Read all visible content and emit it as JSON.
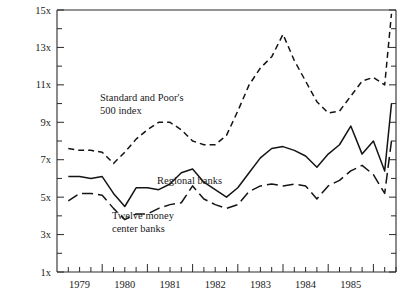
{
  "chart_data": {
    "type": "line",
    "title": "",
    "xlabel": "",
    "ylabel": "",
    "ylim": [
      1,
      15
    ],
    "xlim": [
      1978.5,
      1986.0
    ],
    "grid": false,
    "legend_position": "inline-annotations",
    "y_ticks_major": [
      "1x",
      "3x",
      "5x",
      "7x",
      "9x",
      "11x",
      "13x",
      "15x"
    ],
    "y_tick_values_major": [
      1,
      3,
      5,
      7,
      9,
      11,
      13,
      15
    ],
    "y_tick_values_minor": [
      2,
      4,
      6,
      8,
      10,
      12,
      14
    ],
    "x_tick_labels": [
      "1979",
      "1980",
      "1981",
      "1982",
      "1983",
      "1984",
      "1985"
    ],
    "x_tick_label_values": [
      1979,
      1980,
      1981,
      1982,
      1983,
      1984,
      1985
    ],
    "x_minor_step": 0.25,
    "annotations": [
      {
        "name": "sp500-label",
        "lines": [
          "Standard and Poor's",
          "500 index"
        ],
        "x": 100,
        "y": 101
      },
      {
        "name": "regional-banks-label",
        "lines": [
          "Regional banks"
        ],
        "x": 157,
        "y": 184
      },
      {
        "name": "money-center-label",
        "lines": [
          "Twelve money",
          "center banks"
        ],
        "x": 112,
        "y": 219
      }
    ],
    "series": [
      {
        "name": "Standard and Poor's 500 index",
        "style": "dashed",
        "dash": "6,4",
        "x": [
          1978.75,
          1979.0,
          1979.25,
          1979.5,
          1979.75,
          1980.0,
          1980.25,
          1980.5,
          1980.75,
          1981.0,
          1981.25,
          1981.5,
          1981.75,
          1982.0,
          1982.25,
          1982.5,
          1982.75,
          1983.0,
          1983.25,
          1983.5,
          1983.75,
          1984.0,
          1984.25,
          1984.5,
          1984.75,
          1985.0,
          1985.25,
          1985.5,
          1985.75,
          1985.9
        ],
        "values": [
          7.6,
          7.5,
          7.5,
          7.4,
          6.8,
          7.4,
          8.1,
          8.6,
          9.0,
          9.0,
          8.6,
          8.0,
          7.8,
          7.8,
          8.3,
          9.6,
          11.0,
          11.9,
          12.5,
          13.7,
          12.3,
          11.2,
          10.1,
          9.5,
          9.6,
          10.4,
          11.2,
          11.4,
          11.0,
          14.8
        ]
      },
      {
        "name": "Regional banks",
        "style": "solid",
        "dash": "none",
        "x": [
          1978.75,
          1979.0,
          1979.25,
          1979.5,
          1979.75,
          1980.0,
          1980.25,
          1980.5,
          1980.75,
          1981.0,
          1981.25,
          1981.5,
          1981.75,
          1982.0,
          1982.25,
          1982.5,
          1982.75,
          1983.0,
          1983.25,
          1983.5,
          1983.75,
          1984.0,
          1984.25,
          1984.5,
          1984.75,
          1985.0,
          1985.25,
          1985.5,
          1985.75,
          1985.9
        ],
        "values": [
          6.1,
          6.1,
          6.0,
          6.1,
          5.2,
          4.5,
          5.5,
          5.5,
          5.4,
          5.7,
          6.3,
          6.5,
          5.8,
          5.4,
          5.0,
          5.5,
          6.3,
          7.1,
          7.6,
          7.7,
          7.5,
          7.2,
          6.6,
          7.3,
          7.8,
          8.8,
          7.3,
          8.0,
          6.4,
          10.0
        ]
      },
      {
        "name": "Twelve money center banks",
        "style": "long-dashed",
        "dash": "11,5",
        "x": [
          1978.75,
          1979.0,
          1979.25,
          1979.5,
          1979.75,
          1980.0,
          1980.25,
          1980.5,
          1980.75,
          1981.0,
          1981.25,
          1981.5,
          1981.75,
          1982.0,
          1982.25,
          1982.5,
          1982.75,
          1983.0,
          1983.25,
          1983.5,
          1983.75,
          1984.0,
          1984.25,
          1984.5,
          1984.75,
          1985.0,
          1985.25,
          1985.5,
          1985.75,
          1985.9
        ],
        "values": [
          4.8,
          5.2,
          5.2,
          5.1,
          4.4,
          3.8,
          4.1,
          4.1,
          4.4,
          4.6,
          4.7,
          5.6,
          4.9,
          4.6,
          4.4,
          4.6,
          5.3,
          5.6,
          5.7,
          5.6,
          5.7,
          5.6,
          4.9,
          5.6,
          5.9,
          6.4,
          6.7,
          6.2,
          5.2,
          8.0
        ]
      }
    ]
  },
  "axes": {
    "plot_left": 57,
    "plot_right": 396,
    "plot_top": 10,
    "plot_bottom": 272
  }
}
